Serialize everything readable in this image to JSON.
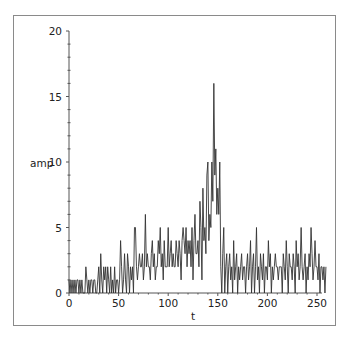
{
  "chart_data": {
    "type": "line",
    "title": "",
    "xlabel": "t",
    "ylabel": "amp",
    "xlim": [
      0,
      255
    ],
    "ylim": [
      0,
      20
    ],
    "x_ticks": [
      0,
      50,
      100,
      150,
      200,
      250
    ],
    "y_ticks": [
      0,
      5,
      10,
      15,
      20
    ],
    "grid": false,
    "legend": null,
    "line_color": "#333333",
    "series": [
      {
        "name": "amp",
        "x_start": 0,
        "x_step": 1,
        "values": [
          1,
          0,
          1,
          0,
          1,
          0,
          1,
          0,
          1,
          1,
          0,
          1,
          0,
          1,
          0,
          0,
          0,
          2,
          1,
          0,
          1,
          0,
          1,
          1,
          0,
          1,
          1,
          0,
          0,
          1,
          2,
          0,
          3,
          1,
          0,
          2,
          1,
          2,
          0,
          2,
          1,
          0,
          2,
          0,
          1,
          0,
          2,
          0,
          1,
          1,
          0,
          1,
          4,
          2,
          0,
          1,
          3,
          1,
          0,
          3,
          2,
          0,
          2,
          1,
          2,
          0,
          5,
          5,
          2,
          1,
          2,
          3,
          2,
          2,
          3,
          1,
          2,
          6,
          2,
          3,
          2,
          2,
          1,
          3,
          4,
          2,
          3,
          1,
          2,
          2,
          4,
          3,
          5,
          2,
          3,
          1,
          4,
          2,
          2,
          2,
          5,
          2,
          3,
          4,
          2,
          3,
          2,
          2,
          4,
          3,
          2,
          4,
          3,
          1,
          4,
          5,
          4,
          3,
          5,
          2,
          4,
          3,
          4,
          2,
          5,
          1,
          4,
          6,
          3,
          3,
          4,
          2,
          7,
          5,
          1,
          8,
          4,
          5,
          3,
          9,
          10,
          4,
          6,
          5,
          10,
          7,
          16,
          9,
          11,
          6,
          8,
          6,
          10,
          2,
          0,
          3,
          5,
          0,
          2,
          3,
          0,
          2,
          3,
          1,
          2,
          0,
          4,
          1,
          2,
          3,
          0,
          2,
          1,
          2,
          3,
          1,
          2,
          2,
          0,
          2,
          3,
          1,
          2,
          4,
          0,
          2,
          3,
          0,
          2,
          5,
          1,
          2,
          0,
          3,
          2,
          1,
          3,
          0,
          2,
          2,
          1,
          4,
          2,
          3,
          0,
          2,
          1,
          2,
          3,
          2,
          2,
          1,
          2,
          2,
          2,
          0,
          3,
          2,
          1,
          4,
          2,
          0,
          3,
          2,
          2,
          1,
          3,
          2,
          0,
          4,
          2,
          3,
          1,
          2,
          5,
          2,
          1,
          2,
          3,
          0,
          2,
          1,
          3,
          2,
          5,
          3,
          1,
          2,
          4,
          2,
          2,
          1,
          3,
          0,
          2,
          2,
          1,
          2,
          0,
          2
        ]
      }
    ]
  }
}
